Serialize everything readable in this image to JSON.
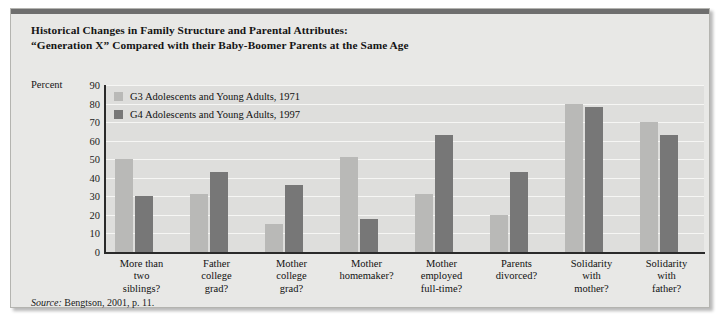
{
  "title": {
    "line1": "Historical Changes in Family Structure and Parental Attributes:",
    "line2": "“Generation X” Compared with their Baby-Boomer Parents at the Same Age"
  },
  "axis": {
    "percent_label": "Percent"
  },
  "source": {
    "prefix": "Source:",
    "text": "Bengtson, 2001, p. 11."
  },
  "colors": {
    "series_g3": "#b9b9b7",
    "series_g4": "#777777",
    "plot_background": "#dededc",
    "card_background": "#e8e8e6",
    "gridline": "#f6f6f4",
    "axis": "#2a2a2a",
    "top_band": "#6e6e6e"
  },
  "chart_data": {
    "type": "bar",
    "title": "Historical Changes in Family Structure and Parental Attributes: “Generation X” Compared with their Baby-Boomer Parents at the Same Age",
    "xlabel": "",
    "ylabel": "Percent",
    "ylim": [
      0,
      90
    ],
    "yticks": [
      0,
      10,
      20,
      30,
      40,
      50,
      60,
      70,
      80,
      90
    ],
    "grid": true,
    "legend_position": "top-left",
    "categories": [
      "More than two siblings?",
      "Father college grad?",
      "Mother college grad?",
      "Mother homemaker?",
      "Mother employed full-time?",
      "Parents divorced?",
      "Solidarity with mother?",
      "Solidarity with father?"
    ],
    "category_lines": [
      [
        "More than",
        "two",
        "siblings?"
      ],
      [
        "Father",
        "college",
        "grad?"
      ],
      [
        "Mother",
        "college",
        "grad?"
      ],
      [
        "Mother",
        "homemaker?"
      ],
      [
        "Mother",
        "employed",
        "full-time?"
      ],
      [
        "Parents",
        "divorced?"
      ],
      [
        "Solidarity",
        "with",
        "mother?"
      ],
      [
        "Solidarity",
        "with",
        "father?"
      ]
    ],
    "series": [
      {
        "name": "G3 Adolescents and Young Adults, 1971",
        "color": "#b9b9b7",
        "values": [
          50,
          31,
          15,
          51,
          31,
          20,
          80,
          70
        ]
      },
      {
        "name": "G4 Adolescents and Young Adults, 1997",
        "color": "#777777",
        "values": [
          30,
          43,
          36,
          18,
          63,
          43,
          78,
          63
        ]
      }
    ]
  }
}
